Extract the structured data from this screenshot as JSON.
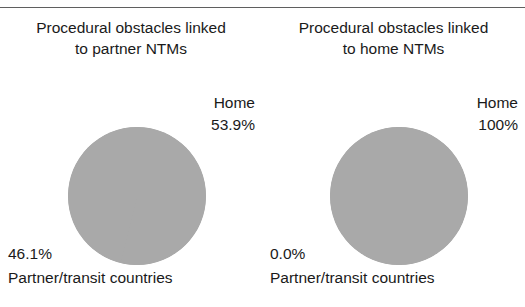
{
  "figure": {
    "clipped_header_text": "",
    "background_color": "#ffffff",
    "slice_color": "#a9a9a9",
    "text_color": "#1a1a1a"
  },
  "chart_data": [
    {
      "type": "pie",
      "title": "Procedural obstacles linked to partner NTMs",
      "title_lines": [
        "Procedural obstacles linked",
        "to partner NTMs"
      ],
      "categories": [
        "Home",
        "Partner/transit countries"
      ],
      "values": [
        53.9,
        46.1
      ],
      "value_labels": [
        "53.9%",
        "46.1%"
      ],
      "legend_position": "callout-labels",
      "grid": false,
      "xlabel": "",
      "ylabel": ""
    },
    {
      "type": "pie",
      "title": "Procedural obstacles linked to home NTMs",
      "title_lines": [
        "Procedural obstacles linked",
        "to home NTMs"
      ],
      "categories": [
        "Home",
        "Partner/transit countries"
      ],
      "values": [
        100,
        0.0
      ],
      "value_labels": [
        "100%",
        "0.0%"
      ],
      "legend_position": "callout-labels",
      "grid": false,
      "xlabel": "",
      "ylabel": ""
    }
  ],
  "panels": {
    "left": {
      "title_line1": "Procedural obstacles linked",
      "title_line2": "to partner NTMs",
      "home_label": "Home",
      "home_value": "53.9%",
      "partner_value": "46.1%",
      "partner_label": "Partner/transit countries"
    },
    "right": {
      "title_line1": "Procedural obstacles linked",
      "title_line2": "to home NTMs",
      "home_label": "Home",
      "home_value": "100%",
      "partner_value": "0.0%",
      "partner_label": "Partner/transit countries"
    }
  }
}
